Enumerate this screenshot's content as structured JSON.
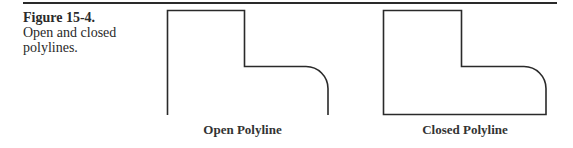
{
  "figure": {
    "number": "Figure 15-4.",
    "caption": "Open and closed polylines."
  },
  "diagrams": [
    {
      "id": "open-polyline",
      "label": "Open Polyline",
      "closed": false
    },
    {
      "id": "closed-polyline",
      "label": "Closed Polyline",
      "closed": true
    }
  ],
  "colors": {
    "stroke": "#2a2a2a",
    "background": "#ffffff"
  }
}
